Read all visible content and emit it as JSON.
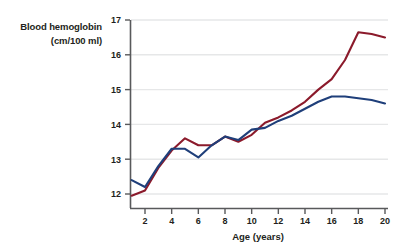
{
  "chart_data": {
    "type": "line",
    "title": "",
    "ylabel_line1": "Blood hemoglobin",
    "ylabel_line2": "(cm/100 ml)",
    "xlabel": "Age (years)",
    "xlim": [
      1,
      20
    ],
    "ylim": [
      11.6,
      17
    ],
    "xticks": [
      2,
      4,
      6,
      8,
      10,
      12,
      14,
      16,
      18,
      20
    ],
    "yticks": [
      12,
      13,
      14,
      15,
      16,
      17
    ],
    "grid": "horizontal",
    "legend": "none",
    "x": [
      1,
      2,
      3,
      4,
      5,
      6,
      7,
      8,
      9,
      10,
      11,
      12,
      13,
      14,
      15,
      16,
      17,
      18,
      19,
      20
    ],
    "series": [
      {
        "name": "male",
        "color": "#8B1A2B",
        "values": [
          11.95,
          12.1,
          12.75,
          13.25,
          13.6,
          13.4,
          13.4,
          13.65,
          13.5,
          13.7,
          14.05,
          14.2,
          14.4,
          14.65,
          15.0,
          15.3,
          15.85,
          16.65,
          16.6,
          16.5
        ]
      },
      {
        "name": "female",
        "color": "#1F3F7A",
        "values": [
          12.4,
          12.2,
          12.8,
          13.3,
          13.3,
          13.05,
          13.4,
          13.65,
          13.55,
          13.85,
          13.9,
          14.1,
          14.25,
          14.45,
          14.65,
          14.8,
          14.8,
          14.75,
          14.7,
          14.6
        ]
      }
    ]
  },
  "axis": {
    "xtick_labels": [
      "2",
      "4",
      "6",
      "8",
      "10",
      "12",
      "14",
      "16",
      "18",
      "20"
    ],
    "ytick_labels": [
      "12",
      "13",
      "14",
      "15",
      "16",
      "17"
    ]
  },
  "colors": {
    "series_red": "#8B1A2B",
    "series_blue": "#1F3F7A",
    "axis": "#58595b",
    "grid": "#e6e7e8",
    "text": "#231f20"
  }
}
